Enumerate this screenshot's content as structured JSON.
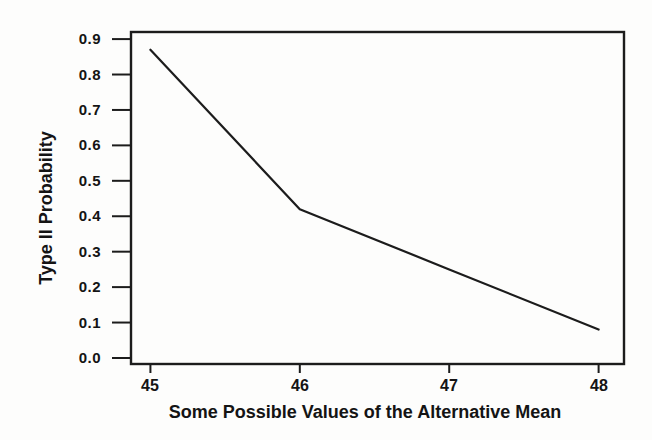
{
  "chart_data": {
    "type": "line",
    "title": "",
    "xlabel": "Some Possible Values of the Alternative Mean",
    "ylabel": "Type II Probability",
    "x": [
      45,
      46,
      47,
      48
    ],
    "y": [
      0.87,
      0.42,
      0.25,
      0.08
    ],
    "x_ticks": [
      "45",
      "46",
      "47",
      "48"
    ],
    "y_ticks": [
      "0.0",
      "0.1",
      "0.2",
      "0.3",
      "0.4",
      "0.5",
      "0.6",
      "0.7",
      "0.8",
      "0.9"
    ],
    "xlim": [
      44.87,
      48.17
    ],
    "ylim": [
      -0.017,
      0.92
    ],
    "grid": false,
    "legend": "none",
    "line_color": "#1c1c1c",
    "axis_color": "#1c1c1c",
    "text_color": "#141414",
    "background": "#fdfdfc"
  }
}
